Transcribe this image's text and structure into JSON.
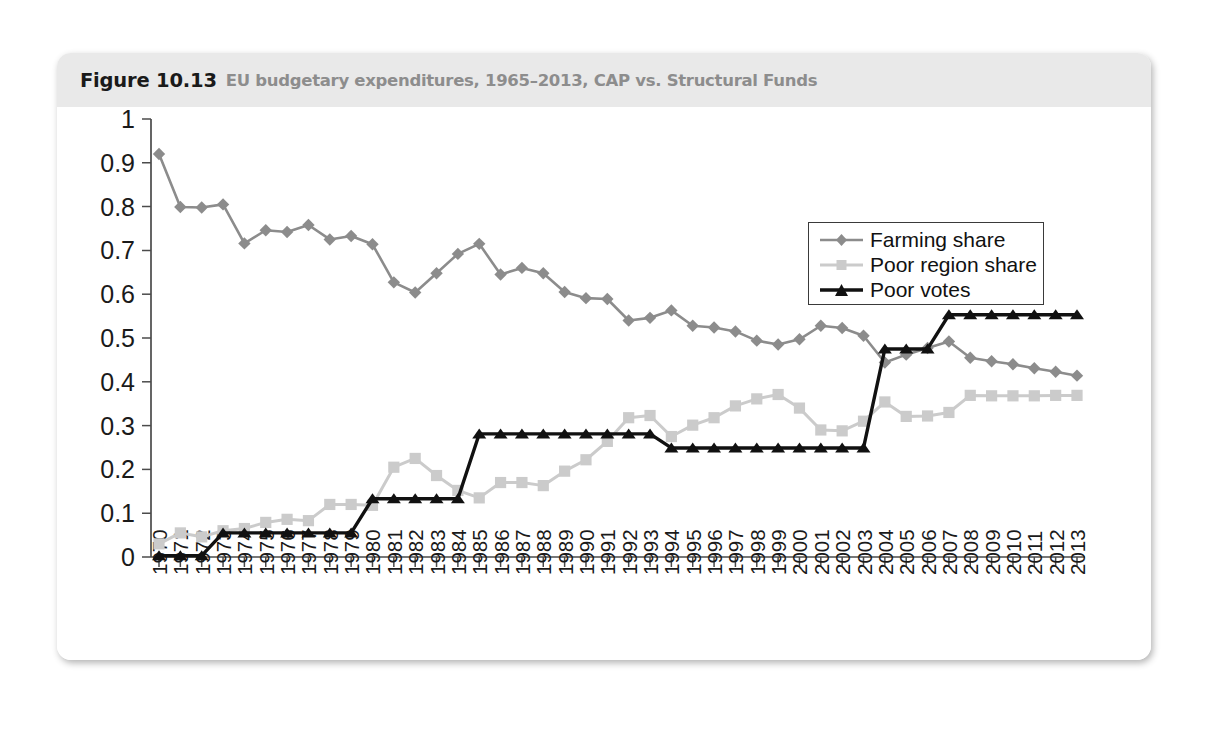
{
  "figure": {
    "number": "Figure 10.13",
    "caption": "EU budgetary expenditures, 1965–2013, CAP vs. Structural Funds"
  },
  "legend": {
    "position": "top-right",
    "entries": [
      {
        "label": "Farming share",
        "color": "#8c8c8c",
        "marker": "diamond"
      },
      {
        "label": "Poor region share",
        "color": "#cbcbcb",
        "marker": "square"
      },
      {
        "label": "Poor votes",
        "color": "#111111",
        "marker": "triangle"
      }
    ]
  },
  "axes": {
    "y_ticks": [
      "0",
      "0.1",
      "0.2",
      "0.3",
      "0.4",
      "0.5",
      "0.6",
      "0.7",
      "0.8",
      "0.9",
      "1"
    ],
    "y_min": 0,
    "y_max": 1,
    "y_step": 0.1,
    "grid": false
  },
  "chart_data": {
    "type": "line",
    "title": "EU budgetary expenditures, 1965–2013, CAP vs. Structural Funds",
    "xlabel": "",
    "ylabel": "",
    "ylim": [
      0,
      1
    ],
    "grid": false,
    "legend_position": "top-right",
    "categories": [
      "1970",
      "1971",
      "1972",
      "1973",
      "1974",
      "1975",
      "1976",
      "1977",
      "1978",
      "1979",
      "1980",
      "1981",
      "1982",
      "1983",
      "1984",
      "1985",
      "1986",
      "1987",
      "1988",
      "1989",
      "1990",
      "1991",
      "1992",
      "1993",
      "1994",
      "1995",
      "1996",
      "1997",
      "1998",
      "1999",
      "2000",
      "2001",
      "2002",
      "2003",
      "2004",
      "2005",
      "2006",
      "2007",
      "2008",
      "2009",
      "2010",
      "2011",
      "2012",
      "2013"
    ],
    "series": [
      {
        "name": "Farming share",
        "color": "#8c8c8c",
        "marker": "diamond",
        "values": [
          0.92,
          0.799,
          0.798,
          0.805,
          0.716,
          0.746,
          0.742,
          0.758,
          0.725,
          0.733,
          0.714,
          0.627,
          0.604,
          0.648,
          0.692,
          0.715,
          0.645,
          0.66,
          0.648,
          0.605,
          0.591,
          0.589,
          0.54,
          0.546,
          0.563,
          0.528,
          0.524,
          0.515,
          0.494,
          0.485,
          0.497,
          0.528,
          0.523,
          0.505,
          0.444,
          0.462,
          0.477,
          0.492,
          0.455,
          0.447,
          0.44,
          0.431,
          0.423,
          0.414
        ]
      },
      {
        "name": "Poor region share",
        "color": "#cbcbcb",
        "marker": "square",
        "values": [
          0.03,
          0.055,
          0.046,
          0.06,
          0.065,
          0.079,
          0.086,
          0.083,
          0.12,
          0.12,
          0.118,
          0.205,
          0.225,
          0.186,
          0.152,
          0.135,
          0.17,
          0.17,
          0.163,
          0.196,
          0.222,
          0.264,
          0.318,
          0.323,
          0.275,
          0.301,
          0.318,
          0.345,
          0.361,
          0.371,
          0.34,
          0.29,
          0.288,
          0.31,
          0.354,
          0.321,
          0.322,
          0.33,
          0.369,
          0.368,
          0.368,
          0.368,
          0.369,
          0.369
        ]
      },
      {
        "name": "Poor votes",
        "color": "#111111",
        "marker": "triangle",
        "values": [
          0.003,
          0.003,
          0.003,
          0.055,
          0.055,
          0.055,
          0.055,
          0.055,
          0.055,
          0.055,
          0.133,
          0.133,
          0.133,
          0.133,
          0.133,
          0.281,
          0.281,
          0.281,
          0.281,
          0.281,
          0.281,
          0.281,
          0.281,
          0.281,
          0.249,
          0.249,
          0.249,
          0.249,
          0.249,
          0.249,
          0.249,
          0.249,
          0.249,
          0.249,
          0.475,
          0.475,
          0.475,
          0.553,
          0.553,
          0.553,
          0.553,
          0.553,
          0.553,
          0.553
        ]
      }
    ]
  }
}
